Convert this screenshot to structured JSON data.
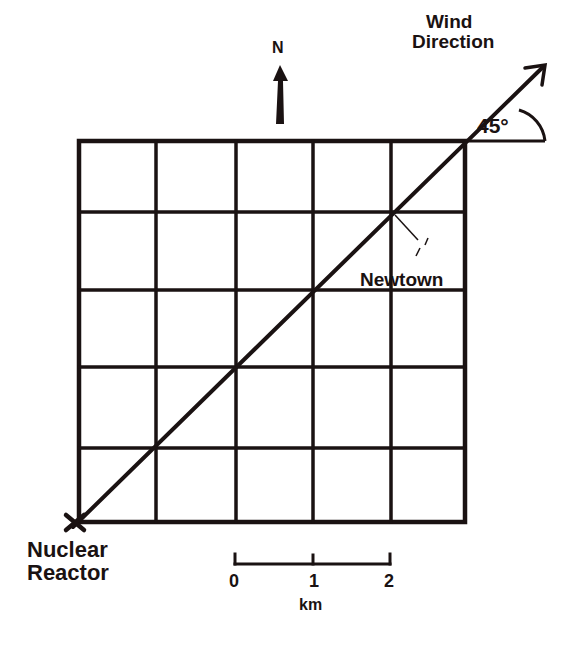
{
  "labels": {
    "wind_direction_line1": "Wind",
    "wind_direction_line2": "Direction",
    "north": "N",
    "angle": "45°",
    "newtown": "Newtown",
    "reactor_line1": "Nuclear",
    "reactor_line2": "Reactor"
  },
  "scale_bar": {
    "ticks": [
      "0",
      "1",
      "2"
    ],
    "unit": "km"
  },
  "grid": {
    "columns": 5,
    "rows": 5,
    "cell_size_km": 1
  },
  "wind": {
    "angle_degrees": 45
  },
  "colors": {
    "ink": "#1a1212",
    "background": "#ffffff"
  }
}
